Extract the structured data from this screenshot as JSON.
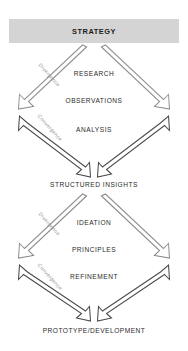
{
  "diagram": {
    "title": "STRATEGY",
    "type": "double-diamond",
    "accent_color": "#d4d4d4",
    "line_color": "#4a4a4a",
    "phase_label_color": "#8d8d8d",
    "header": {
      "label": "STRATEGY"
    },
    "diamonds": [
      {
        "name": "problem-space",
        "phases": [
          {
            "label": "Divergence",
            "direction": "down-right"
          },
          {
            "label": "Convergence",
            "direction": "down-right"
          }
        ],
        "stages": [
          {
            "label": "RESEARCH"
          },
          {
            "label": "OBSERVATIONS"
          },
          {
            "label": "ANALYSIS"
          }
        ],
        "outcome": {
          "label": "STRUCTURED INSIGHTS"
        }
      },
      {
        "name": "solution-space",
        "phases": [
          {
            "label": "Divergence",
            "direction": "down-right"
          },
          {
            "label": "Convergence",
            "direction": "down-right"
          }
        ],
        "stages": [
          {
            "label": "IDEATION"
          },
          {
            "label": "PRINCIPLES"
          },
          {
            "label": "REFINEMENT"
          }
        ],
        "outcome": {
          "label": "PROTOTYPE/DEVELOPMENT"
        }
      }
    ]
  }
}
